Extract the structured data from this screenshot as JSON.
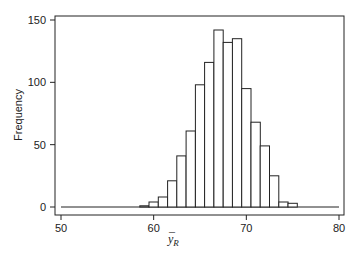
{
  "chart_data": {
    "type": "bar",
    "subtype": "histogram",
    "title": "",
    "xlabel": "ȳ_R",
    "xlabel_main": "y",
    "xlabel_sub": "R",
    "xlabel_accent": "¯",
    "ylabel": "Frequency",
    "xlim": [
      50,
      80
    ],
    "ylim": [
      0,
      150
    ],
    "x_ticks": [
      50,
      60,
      70,
      80
    ],
    "y_ticks": [
      0,
      50,
      100,
      150
    ],
    "bin_width": 1,
    "bin_edges": [
      58.5,
      59.5,
      60.5,
      61.5,
      62.5,
      63.5,
      64.5,
      65.5,
      66.5,
      67.5,
      68.5,
      69.5,
      70.5,
      71.5,
      72.5,
      73.5,
      74.5,
      75.5
    ],
    "categories": [
      59,
      60,
      61,
      62,
      63,
      64,
      65,
      66,
      67,
      68,
      69,
      70,
      71,
      72,
      73,
      74,
      75
    ],
    "values": [
      1,
      4,
      8,
      21,
      41,
      61,
      98,
      116,
      142,
      132,
      135,
      95,
      68,
      49,
      25,
      4,
      3
    ],
    "grid": false,
    "legend": null,
    "bar_fill": "#ffffff",
    "bar_stroke": "#222222"
  }
}
